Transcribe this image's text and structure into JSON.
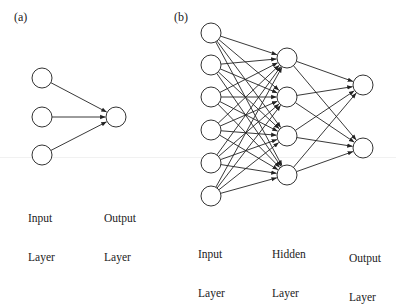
{
  "panels": [
    {
      "id": "a",
      "label": "(a)",
      "label_pos": [
        14,
        10
      ],
      "layers": [
        {
          "name": "Input Layer",
          "label_line1": "Input",
          "label_line2": "Layer",
          "label_pos": [
            28,
            186
          ],
          "nodes": [
            [
              42,
              78
            ],
            [
              42,
              117
            ],
            [
              42,
              155
            ]
          ]
        },
        {
          "name": "Output Layer",
          "label_line1": "Output",
          "label_line2": "Layer",
          "label_pos": [
            104,
            186
          ],
          "nodes": [
            [
              116,
              117
            ]
          ]
        }
      ]
    },
    {
      "id": "b",
      "label": "(b)",
      "label_pos": [
        174,
        10
      ],
      "layers": [
        {
          "name": "Input Layer",
          "label_line1": "Input",
          "label_line2": "Layer",
          "label_pos": [
            198,
            222
          ],
          "nodes": [
            [
              211,
              33
            ],
            [
              211,
              65
            ],
            [
              211,
              97
            ],
            [
              211,
              130
            ],
            [
              211,
              163
            ],
            [
              211,
              196
            ]
          ]
        },
        {
          "name": "Hidden Layer",
          "label_line1": "Hidden",
          "label_line2": "Layer",
          "label_pos": [
            272,
            222
          ],
          "nodes": [
            [
              287,
              58
            ],
            [
              287,
              97
            ],
            [
              287,
              136
            ],
            [
              287,
              175
            ]
          ]
        },
        {
          "name": "Output Layer",
          "label_line1": "Output",
          "label_line2": "Layer",
          "label_pos": [
            349,
            226
          ],
          "nodes": [
            [
              363,
              85
            ],
            [
              363,
              148
            ]
          ]
        }
      ]
    }
  ],
  "style": {
    "node_radius": 10,
    "stroke_color": "#333333",
    "edge_color": "#222222",
    "background": "#ffffff"
  }
}
